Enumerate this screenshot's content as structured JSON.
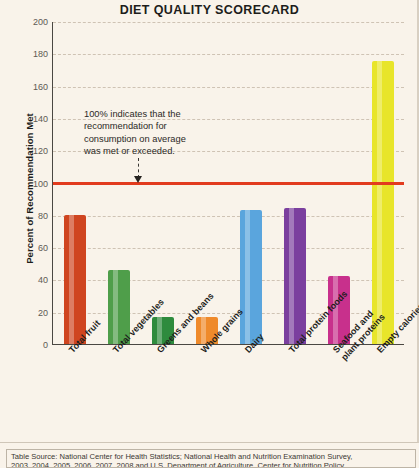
{
  "chart_data": {
    "type": "bar",
    "title": "DIET QUALITY SCORECARD",
    "xlabel": "",
    "ylabel": "Percent of Recommendation Met",
    "ylim": [
      0,
      200
    ],
    "ytick_step": 20,
    "yticks": [
      200,
      180,
      160,
      140,
      120,
      100,
      80,
      60,
      40,
      20,
      0
    ],
    "grid": true,
    "legend": "none",
    "categories": [
      "Total fruit",
      "Total vegetables",
      "Greens and beans",
      "Whole grains",
      "Dairy",
      "Total protein foods",
      "Seafood and plant proteins",
      "Empty calories"
    ],
    "category_lines": [
      [
        "Total fruit"
      ],
      [
        "Total vegetables"
      ],
      [
        "Greens and beans"
      ],
      [
        "Whole grains"
      ],
      [
        "Dairy"
      ],
      [
        "Total protein foods"
      ],
      [
        "Seafood and",
        "plant proteins"
      ],
      [
        "Empty calories"
      ]
    ],
    "values": [
      80,
      46,
      17,
      17,
      83,
      84,
      42,
      175
    ],
    "colors": [
      "#cf4520",
      "#4f9e4a",
      "#2e8b3d",
      "#ef8a2b",
      "#5aa5dd",
      "#7b3f9e",
      "#c8308c",
      "#e8e52a"
    ],
    "reference_line": {
      "value": 100,
      "color": "#e23b1e",
      "label": "100%"
    },
    "annotation": {
      "lines": [
        "100% indicates that the",
        "recommendation for",
        "consumption on average",
        "was met or exceeded."
      ],
      "points_to": 100
    }
  },
  "footnote": {
    "line1": "Table Source: National Center for Health Statistics; National Health and Nutrition Examination Survey,",
    "line2": "2003, 2004, 2005, 2006, 2007, 2008 and U.S. Department of Agriculture, Center for Nutrition Policy"
  }
}
